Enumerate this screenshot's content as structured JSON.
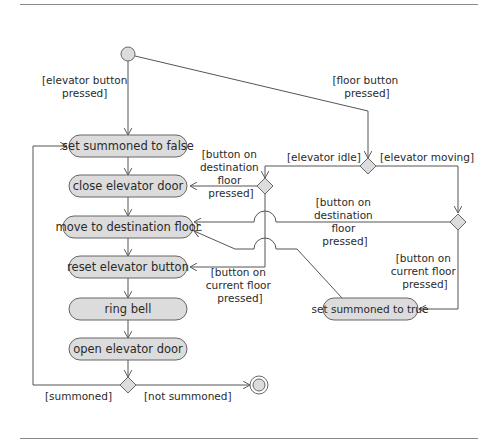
{
  "diagram": {
    "type": "uml-activity-diagram",
    "colors": {
      "line": "#555555",
      "node_fill": "#dcdcdc",
      "node_stroke": "#666666",
      "text": "#2a2a2a",
      "rule": "#8a8a8a"
    },
    "activities": [
      {
        "id": "a1",
        "label": "set summoned to false"
      },
      {
        "id": "a2",
        "label": "close elevator door"
      },
      {
        "id": "a3",
        "label": "move to destination floor"
      },
      {
        "id": "a4",
        "label": "reset elevator button"
      },
      {
        "id": "a5",
        "label": "ring bell"
      },
      {
        "id": "a6",
        "label": "open elevator door"
      },
      {
        "id": "a7",
        "label": "set summoned to true"
      }
    ],
    "guards": {
      "elevator_button_pressed": [
        "[elevator button",
        "pressed]"
      ],
      "floor_button_pressed": [
        "[floor button",
        "pressed]"
      ],
      "elevator_idle": "[elevator idle]",
      "elevator_moving": "[elevator moving]",
      "dest_floor_left": [
        "[button on",
        "destination",
        "floor",
        "pressed]"
      ],
      "dest_floor_mid": [
        "[button on",
        "destination",
        "floor",
        "pressed]"
      ],
      "current_floor_left": [
        "[button on",
        "current floor",
        "pressed]"
      ],
      "current_floor_right": [
        "[button on",
        "current floor",
        "pressed]"
      ],
      "summoned": "[summoned]",
      "not_summoned": "[not summoned]"
    },
    "nodes": {
      "initial": "initial-node",
      "final": "final-node",
      "decisions": [
        "decision-floor-state",
        "decision-idle",
        "decision-moving",
        "decision-summoned"
      ]
    }
  }
}
